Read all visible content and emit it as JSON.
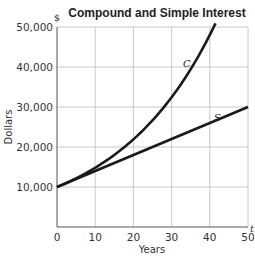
{
  "chart_data": {
    "type": "line",
    "title": "Compound and Simple Interest",
    "xlabel": "Years",
    "ylabel": "Dollars",
    "y_unit_label": "$",
    "x_unit_label": "t",
    "xlim": [
      0,
      50
    ],
    "ylim": [
      0,
      50000
    ],
    "x_ticks": [
      0,
      10,
      20,
      30,
      40,
      50
    ],
    "x_tick_labels": [
      "0",
      "10",
      "20",
      "30",
      "40",
      "50"
    ],
    "y_ticks": [
      10000,
      20000,
      30000,
      40000,
      50000
    ],
    "y_tick_labels": [
      "10,000",
      "20,000",
      "30,000",
      "40,000",
      "50,000"
    ],
    "grid": true,
    "legend": "none (curves labeled inline)",
    "series": [
      {
        "name": "C",
        "description": "Compound interest",
        "x": [
          0,
          5,
          10,
          15,
          20,
          25,
          30,
          35,
          40,
          41.5
        ],
        "values": [
          10000,
          12167,
          14802,
          18009,
          21911,
          26658,
          32434,
          39461,
          48010,
          50000
        ]
      },
      {
        "name": "S",
        "description": "Simple interest",
        "x": [
          0,
          10,
          20,
          30,
          40,
          50
        ],
        "values": [
          10000,
          14000,
          18000,
          22000,
          26000,
          30000
        ]
      }
    ],
    "annotations": [
      {
        "text": "C",
        "x": 34,
        "y": 40000
      },
      {
        "text": "S",
        "x": 42,
        "y": 26500
      }
    ]
  }
}
